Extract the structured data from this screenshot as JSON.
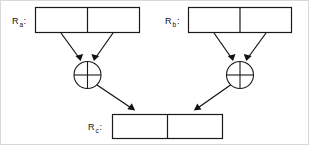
{
  "diagram": {
    "colors": {
      "stroke": "#1a1a1a",
      "background": "#ffffff",
      "frame": "#d8d8d8"
    },
    "registers": [
      {
        "id": "ra",
        "label": "R",
        "subscript": "a",
        "suffix": ":",
        "cells": [
          "",
          ""
        ]
      },
      {
        "id": "rb",
        "label": "R",
        "subscript": "b",
        "suffix": ":",
        "cells": [
          "",
          ""
        ]
      },
      {
        "id": "rc",
        "label": "R",
        "subscript": "c",
        "suffix": ":",
        "cells": [
          "",
          ""
        ]
      }
    ],
    "operators": [
      {
        "id": "xor-left",
        "symbol": "xor-circle-icon",
        "name": "xor"
      },
      {
        "id": "xor-right",
        "symbol": "xor-circle-icon",
        "name": "xor"
      }
    ],
    "connections": [
      {
        "from": "ra.cell0",
        "to": "xor-left"
      },
      {
        "from": "ra.cell1",
        "to": "xor-left"
      },
      {
        "from": "rb.cell0",
        "to": "xor-right"
      },
      {
        "from": "rb.cell1",
        "to": "xor-right"
      },
      {
        "from": "xor-left",
        "to": "rc.cell0"
      },
      {
        "from": "xor-right",
        "to": "rc.cell1"
      }
    ]
  }
}
